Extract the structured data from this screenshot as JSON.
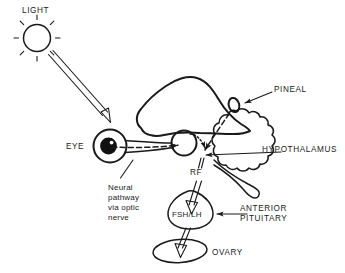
{
  "diagram": {
    "labels": {
      "light": "LIGHT",
      "eye": "EYE",
      "pineal": "PINEAL",
      "hypothalamus": "HYPOTHALAMUS",
      "rf": "RF",
      "fsh_lh": "FSH/LH",
      "anterior_pituitary_line1": "ANTERIOR",
      "anterior_pituitary_line2": "PITUITARY",
      "ovary": "OVARY",
      "neural_pathway_line1": "Neural",
      "neural_pathway_line2": "pathway",
      "neural_pathway_line3": "via optic",
      "neural_pathway_line4": "nerve"
    },
    "colors": {
      "ink": "#1a1a1a",
      "background": "#ffffff",
      "pupil": "#111111"
    },
    "structures": [
      {
        "name": "sun",
        "label": "LIGHT"
      },
      {
        "name": "eye",
        "label": "EYE"
      },
      {
        "name": "optic-nerve",
        "label": "Neural pathway via optic nerve"
      },
      {
        "name": "cerebrum",
        "label": ""
      },
      {
        "name": "cerebellum",
        "label": ""
      },
      {
        "name": "pineal-gland",
        "label": "PINEAL"
      },
      {
        "name": "hypothalamus",
        "label": "HYPOTHALAMUS"
      },
      {
        "name": "releasing-factor",
        "label": "RF"
      },
      {
        "name": "anterior-pituitary",
        "label": "FSH/LH"
      },
      {
        "name": "ovary",
        "label": "OVARY"
      }
    ],
    "flow": [
      {
        "from": "LIGHT",
        "to": "EYE"
      },
      {
        "from": "EYE",
        "to": "HYPOTHALAMUS"
      },
      {
        "from": "PINEAL",
        "to": "HYPOTHALAMUS"
      },
      {
        "from": "RF",
        "to": "FSH/LH"
      },
      {
        "from": "FSH/LH",
        "to": "OVARY"
      }
    ]
  }
}
